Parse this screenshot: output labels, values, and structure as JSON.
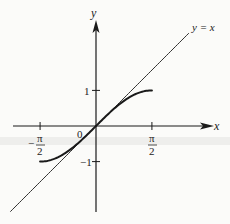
{
  "chart_data": {
    "type": "line",
    "title": "",
    "xlabel": "x",
    "ylabel": "y",
    "xlim": [
      -2.5,
      3.3
    ],
    "ylim": [
      -2.4,
      2.9
    ],
    "grid": false,
    "x_ticks": [
      {
        "value": -1.5708,
        "label_num": "π",
        "label_den": "2",
        "sign": "−"
      },
      {
        "value": 1.5708,
        "label_num": "π",
        "label_den": "2",
        "sign": ""
      }
    ],
    "y_ticks": [
      {
        "value": 1,
        "label": "1"
      },
      {
        "value": -1,
        "label": "−1"
      }
    ],
    "origin_label": "0",
    "series": [
      {
        "name": "y = sin x",
        "domain": [
          -1.5708,
          1.5708
        ],
        "function": "sin(x)",
        "style": "thick"
      },
      {
        "name": "y = x",
        "domain": [
          -2.4,
          2.6
        ],
        "function": "x",
        "style": "thin",
        "label": "y = x"
      }
    ]
  },
  "labels": {
    "x_axis": "x",
    "y_axis": "y",
    "line_label": "y = x",
    "origin": "0",
    "y_tick_pos": "1",
    "y_tick_neg": "−1",
    "pi": "π",
    "two": "2",
    "minus": "−"
  },
  "colors": {
    "ink": "#1a1a1a",
    "background": "#fbfbf9",
    "band": "#eeeeec"
  }
}
